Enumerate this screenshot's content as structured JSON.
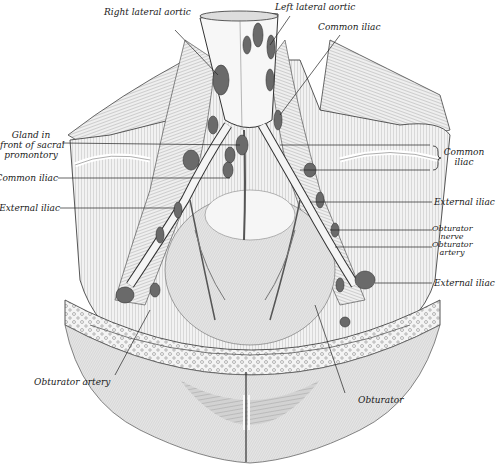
{
  "figure": {
    "background": "#ffffff",
    "ink": "#1a1a1a",
    "node_fill": "#6d6d6d",
    "muscle_fill": "#e4e4e4",
    "shadow_fill": "#bdbdbd"
  },
  "labels": {
    "right_lateral_aortic": "Right lateral aortic",
    "left_lateral_aortic": "Left lateral aortic",
    "common_iliac_top": "Common iliac",
    "gland_line1": "Gland in",
    "gland_line2": "front of sacral",
    "gland_line3": "promontory",
    "common_iliac_left": "Common iliac",
    "external_iliac_left": "External iliac",
    "common_iliac_right_line1": "Common",
    "common_iliac_right_line2": "iliac",
    "external_iliac_right": "External iliac",
    "obturator_nerve_line1": "Obturator",
    "obturator_nerve_line2": "nerve",
    "obturator_artery_right_line1": "Obturator",
    "obturator_artery_right_line2": "artery",
    "external_iliac_lower": "External iliac",
    "obturator_artery_bottom": "Obturator artery",
    "obturator_bottom": "Obturator"
  }
}
